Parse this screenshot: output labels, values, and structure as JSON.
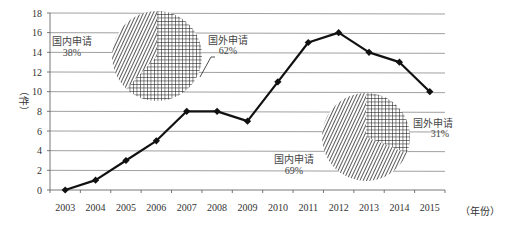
{
  "chart_data": {
    "type": "line",
    "title": "",
    "xlabel": "（年份）",
    "ylabel": "（件）",
    "ylim": [
      0,
      18
    ],
    "yticks": [
      0,
      2,
      4,
      6,
      8,
      10,
      12,
      14,
      16,
      18
    ],
    "grid": true,
    "categories": [
      "2003",
      "2004",
      "2005",
      "2006",
      "2007",
      "2008",
      "2009",
      "2010",
      "2011",
      "2012",
      "2013",
      "2014",
      "2015"
    ],
    "series": [
      {
        "name": "申请量",
        "values": [
          0,
          1,
          3,
          5,
          8,
          8,
          7,
          11,
          15,
          16,
          14,
          13,
          10
        ]
      }
    ],
    "inset_pies": [
      {
        "position": "upper-left",
        "slices": [
          {
            "label": "国内申请",
            "value": 38,
            "display": "38%",
            "pattern": "diagonal-hatch"
          },
          {
            "label": "国外申请",
            "value": 62,
            "display": "62%",
            "pattern": "grid"
          }
        ]
      },
      {
        "position": "lower-right",
        "slices": [
          {
            "label": "国内申请",
            "value": 69,
            "display": "69%",
            "pattern": "diagonal-hatch"
          },
          {
            "label": "国外申请",
            "value": 31,
            "display": "31%",
            "pattern": "grid"
          }
        ]
      }
    ]
  },
  "labels": {
    "y_unit": "（件）",
    "x_unit": "（年份）",
    "pie1_domestic_name": "国内申请",
    "pie1_domestic_pct": "38%",
    "pie1_foreign_name": "国外申请",
    "pie1_foreign_pct": "62%",
    "pie2_domestic_name": "国内申请",
    "pie2_domestic_pct": "69%",
    "pie2_foreign_name": "国外申请",
    "pie2_foreign_pct": "31%"
  },
  "colors": {
    "line": "#111111",
    "grid": "#888888",
    "axis": "#555555",
    "text": "#333333"
  }
}
